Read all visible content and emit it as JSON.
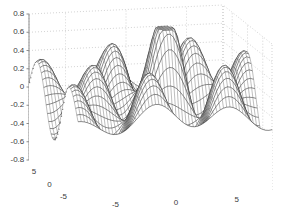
{
  "figure": {
    "title": "",
    "background_color": "#ffffff",
    "width": 287,
    "height": 221
  },
  "chart_data": {
    "type": "surface",
    "render": "mesh-wireframe",
    "title": "",
    "xlabel": "",
    "ylabel": "",
    "zlabel": "",
    "grid": true,
    "legend": null,
    "colormap": "gray",
    "xlim": [
      -8,
      8
    ],
    "ylim": [
      -8,
      8
    ],
    "zlim": [
      -0.8,
      0.8
    ],
    "xticks": [
      -5,
      0,
      5
    ],
    "yticks": [
      5,
      0,
      -5
    ],
    "zticks": [
      -0.8,
      -0.6,
      -0.4,
      -0.2,
      0,
      0.2,
      0.4,
      0.6,
      0.8
    ],
    "xtick_labels": [
      "-5",
      "0",
      "5"
    ],
    "ytick_labels": [
      "5",
      "0",
      "-5"
    ],
    "ztick_labels": [
      "-0.8",
      "-0.6",
      "-0.4",
      "-0.2",
      "0",
      "0.2",
      "0.4",
      "0.6",
      "0.8"
    ],
    "function": "sinc-ripple: sin(r)/r style oscillating surface",
    "formula": "z = sin(sqrt(x^2+y^2)) / sqrt(x^2+y^2) modulated by sin(x)",
    "grid_samples_x": 61,
    "grid_samples_y": 41,
    "view_azimuth": -37.5,
    "view_elevation": 12,
    "z_peak_max": 0.65,
    "z_peak_min": -0.78,
    "mesh_line_color": "#262626",
    "grid_line_color": "#bdbdbd",
    "axis_line_color": "#8c8c8c",
    "tick_text_color": "#3b3b3b"
  },
  "axes": {
    "z": {
      "ticks": [
        {
          "label": "0.8",
          "value": 0.8
        },
        {
          "label": "0.6",
          "value": 0.6
        },
        {
          "label": "0.4",
          "value": 0.4
        },
        {
          "label": "0.2",
          "value": 0.2
        },
        {
          "label": "0",
          "value": 0
        },
        {
          "label": "-0.2",
          "value": -0.2
        },
        {
          "label": "-0.4",
          "value": -0.4
        },
        {
          "label": "-0.6",
          "value": -0.6
        },
        {
          "label": "-0.8",
          "value": -0.8
        }
      ]
    },
    "y": {
      "ticks": [
        {
          "label": "5",
          "value": 5
        },
        {
          "label": "0",
          "value": 0
        },
        {
          "label": "-5",
          "value": -5
        }
      ]
    },
    "x": {
      "ticks": [
        {
          "label": "-5",
          "value": -5
        },
        {
          "label": "0",
          "value": 0
        },
        {
          "label": "5",
          "value": 5
        }
      ]
    }
  }
}
